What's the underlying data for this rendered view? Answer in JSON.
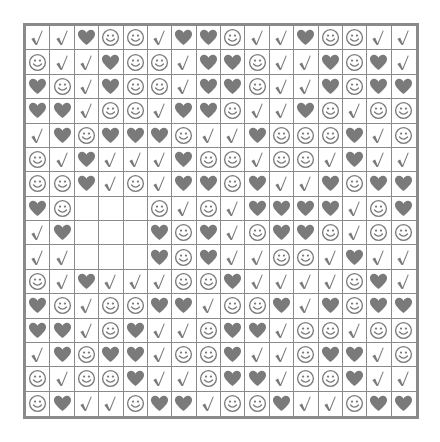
{
  "puzzle": {
    "symbols": {
      "C": "check-icon",
      "H": "heart-icon",
      "S": "smiley-icon",
      "_": "empty"
    },
    "colors": {
      "ink": "#7a7a7a",
      "grid": "#8a8a8a",
      "background": "#ffffff"
    },
    "rows": [
      "CCHSSCHHSCCHSSCC",
      "SCCHSSCHHSCCHSHC",
      "HSCHSSCHHSCCHSHH",
      "HHCSSCHHSCCHSCSS",
      "CHSHHHSCCHSSSHCS",
      "SCHCCCHSSCSSCHCC",
      "SSHCSCHHSHCCHSHH",
      "HS___SCSCHHHHCSH",
      "CH___HSHCSHHSCSS",
      "CC___HSHCCSSCHCC",
      "SCHCCCSSHCCCCSHC",
      "HSCSSHHCSSHCHSHH",
      "HHCSHCCSHHCSSCSS",
      "CHSHHCSSHCCSHHCS",
      "SCSSHCCSHHCSSHCC",
      "SHCCSHHCSSHCCSHH"
    ]
  }
}
